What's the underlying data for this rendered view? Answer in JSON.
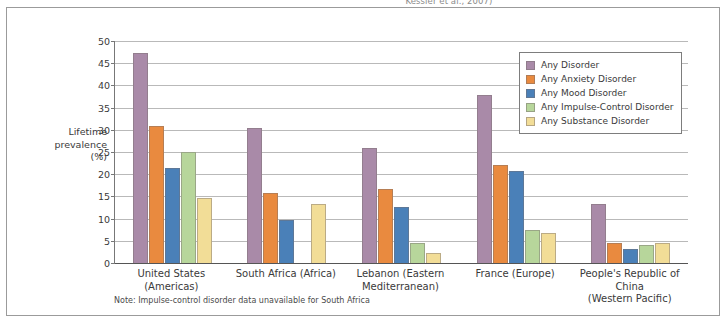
{
  "caption_sliver": "Kessler et al., 2007)",
  "axis_title_lines": [
    "Lifetime",
    "prevalence",
    "(%)"
  ],
  "note": "Note: Impulse-control disorder data unavailable for South Africa",
  "colors": {
    "any_disorder": "#a98aa8",
    "any_anxiety_disorder": "#e98a3f",
    "any_mood_disorder": "#4a80b8",
    "any_impulse_control_disorder": "#b7d69b",
    "any_substance_disorder": "#f2dd97",
    "gridline": "#b9b9b9",
    "frame": "#9b9b9b",
    "text": "#3a3a3a"
  },
  "chart_data": {
    "type": "bar",
    "title": "",
    "xlabel": "",
    "ylabel": "Lifetime prevalence (%)",
    "ylim": [
      0,
      50
    ],
    "yticks": [
      0,
      5,
      10,
      15,
      20,
      25,
      30,
      35,
      40,
      45,
      50
    ],
    "grid": true,
    "legend_position": "top-right",
    "categories": [
      "United States (Americas)",
      "South Africa (Africa)",
      "Lebanon (Eastern\nMediterranean)",
      "France (Europe)",
      "People's Republic of China\n(Western Pacific)"
    ],
    "category_lines": [
      [
        "United States (Americas)"
      ],
      [
        "South Africa (Africa)"
      ],
      [
        "Lebanon (Eastern",
        "Mediterranean)"
      ],
      [
        "France (Europe)"
      ],
      [
        "People's Republic of China",
        "(Western Pacific)"
      ]
    ],
    "series": [
      {
        "name": "Any Disorder",
        "color": "#a98aa8",
        "values": [
          47.4,
          30.3,
          25.8,
          37.9,
          13.2
        ]
      },
      {
        "name": "Any Anxiety Disorder",
        "color": "#e98a3f",
        "values": [
          30.8,
          15.8,
          16.7,
          22.0,
          4.6
        ]
      },
      {
        "name": "Any Mood Disorder",
        "color": "#4a80b8",
        "values": [
          21.4,
          9.8,
          12.6,
          20.7,
          3.2
        ]
      },
      {
        "name": "Any Impulse-Control Disorder",
        "color": "#b7d69b",
        "values": [
          25.0,
          null,
          4.4,
          7.4,
          4.0
        ]
      },
      {
        "name": "Any Substance Disorder",
        "color": "#f2dd97",
        "values": [
          14.6,
          13.3,
          2.2,
          6.8,
          4.6
        ]
      }
    ]
  }
}
